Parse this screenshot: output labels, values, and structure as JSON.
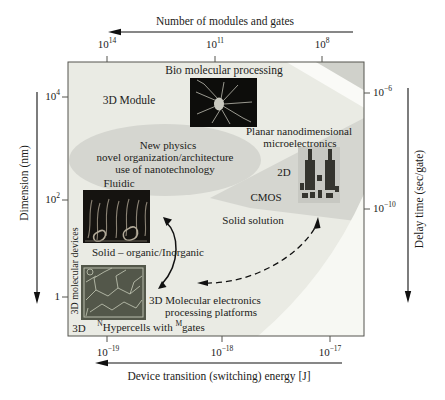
{
  "figure": {
    "type": "conceptual-diagram"
  },
  "axes": {
    "top": {
      "title": "Number of modules and gates",
      "ticks": [
        {
          "base": "10",
          "exp": "14"
        },
        {
          "base": "10",
          "exp": "11"
        },
        {
          "base": "10",
          "exp": "8"
        }
      ]
    },
    "bottom": {
      "title": "Device transition (switching) energy [J]",
      "ticks": [
        {
          "base": "10",
          "exp": "−19"
        },
        {
          "base": "10",
          "exp": "−18"
        },
        {
          "base": "10",
          "exp": "−17"
        }
      ]
    },
    "left": {
      "title": "Dimension (nm)",
      "ticks": [
        {
          "base": "10",
          "exp": "4"
        },
        {
          "base": "10",
          "exp": "2"
        },
        {
          "base": "1",
          "exp": ""
        }
      ]
    },
    "right": {
      "title": "Delay time (sec/gate)",
      "ticks": [
        {
          "base": "10",
          "exp": "−6"
        },
        {
          "base": "10",
          "exp": "−10"
        }
      ]
    }
  },
  "labels": {
    "bio_processing": "Bio molecular processing",
    "module_3d": "3D Module",
    "newphysics_l1": "New physics",
    "newphysics_l2": "novel organization/architecture",
    "newphysics_l3": "use of nanotechnology",
    "planar_l1": "Planar nanodimensional",
    "planar_l2": "microelectronics",
    "two_d": "2D",
    "cmos": "CMOS",
    "solid_solution": "Solid solution",
    "fluidic": "Fluidic",
    "solid_organic": "Solid – organic/Inorganic",
    "mol3d_l1": "3D Molecular electronics",
    "mol3d_l2": "processing platforms",
    "three_d": "3D",
    "hypercells": {
      "sup1": "N",
      "mid": "Hypercells with ",
      "sup2": "M",
      "end": "gates"
    },
    "devices_3d": "3D molecular devices"
  },
  "colors": {
    "plot_bg": "#eaebe4",
    "band_gray": "#d5d6d0",
    "corner_gray": "#d0d1cb",
    "white_stripe": "#fafaf7",
    "white_corner": "#f7f8f3",
    "frame": "#55544f",
    "ink": "#1c1c1a"
  }
}
